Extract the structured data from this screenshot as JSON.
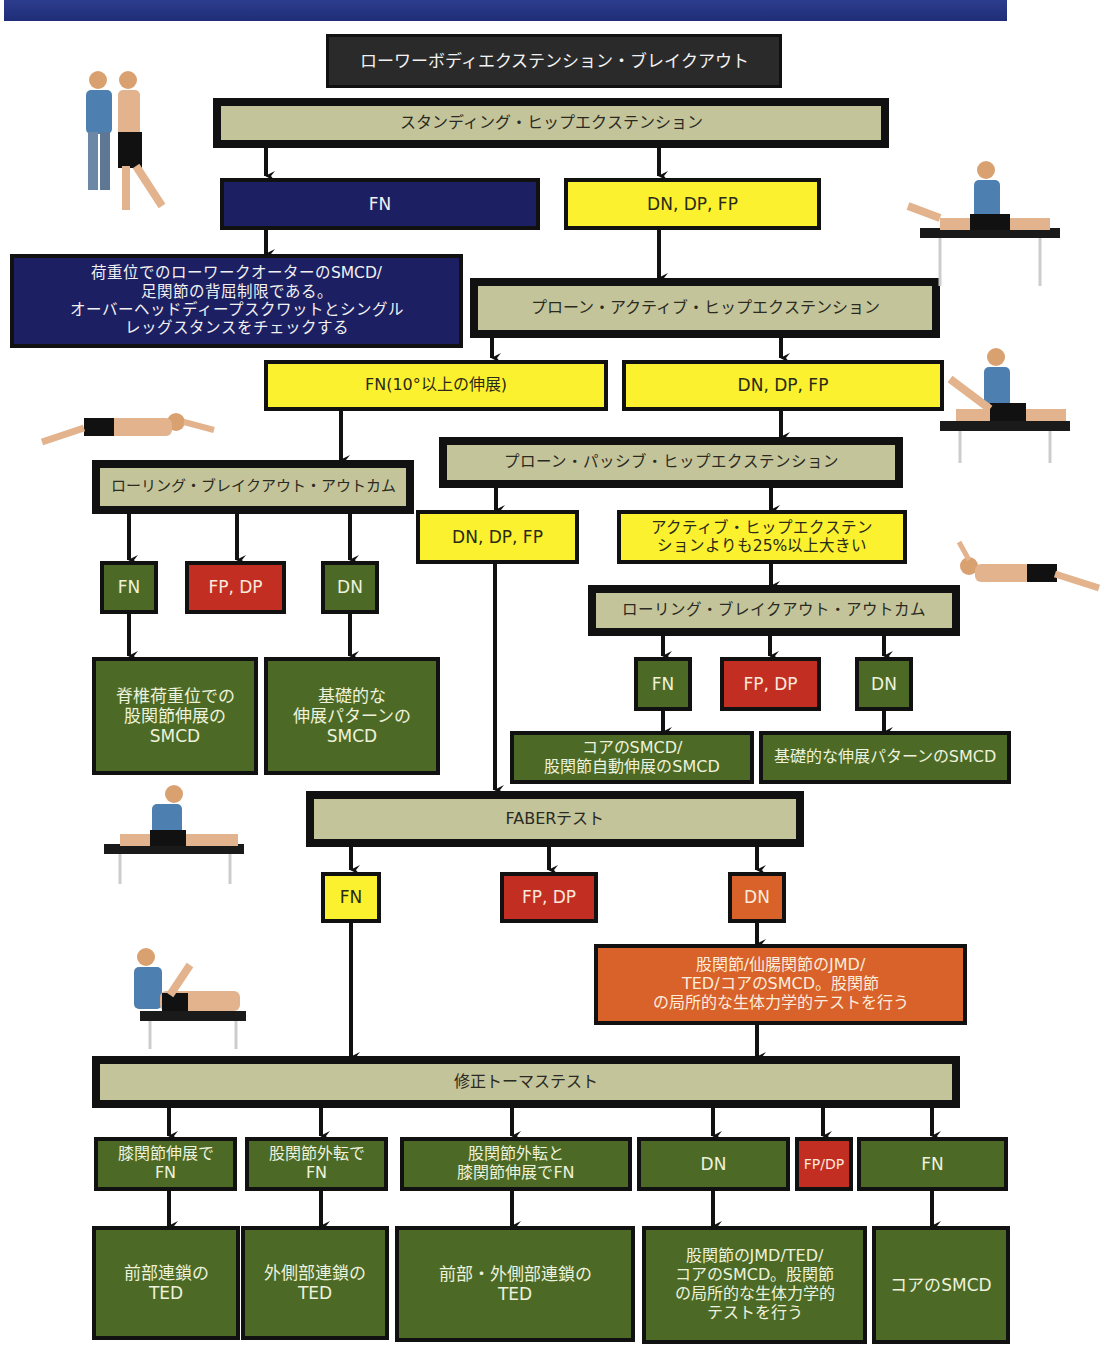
{
  "diagram": {
    "title": "ローワーボディエクステンション・ブレイクアウト",
    "standing": {
      "test": "スタンディング・ヒップエクステンション",
      "fn": "FN",
      "fn_result": "荷重位でのローワークオーターのSMCD/\n足関節の背屈制限である。\nオーバーヘッドディープスクワットとシングル\nレッグスタンスをチェックする",
      "dn": "DN, DP, FP"
    },
    "prone_active": {
      "test": "プローン・アクティブ・ヒップエクステンション",
      "fn": "FN(10°以上の伸展)",
      "dn": "DN, DP, FP"
    },
    "rolling_left": {
      "test": "ローリング・ブレイクアウト・アウトカム",
      "fn": "FN",
      "fp": "FP, DP",
      "dn": "DN",
      "fn_result": "脊椎荷重位での\n股関節伸展の\nSMCD",
      "dn_result": "基礎的な\n伸展パターンの\nSMCD"
    },
    "prone_passive": {
      "test": "プローン・パッシブ・ヒップエクステンション",
      "dn": "DN, DP, FP",
      "greater": "アクティブ・ヒップエクステン\nションよりも25%以上大きい"
    },
    "rolling_right": {
      "test": "ローリング・ブレイクアウト・アウトカム",
      "fn": "FN",
      "fp": "FP, DP",
      "dn": "DN",
      "fn_result": "コアのSMCD/\n股関節自動伸展のSMCD",
      "dn_result": "基礎的な伸展パターンのSMCD"
    },
    "faber": {
      "test": "FABERテスト",
      "fn": "FN",
      "fp": "FP, DP",
      "dn": "DN",
      "dn_result": "股関節/仙腸関節のJMD/\nTED/コアのSMCD。股関節\nの局所的な生体力学的テストを行う"
    },
    "thomas": {
      "test": "修正トーマステスト",
      "outcomes": [
        {
          "label": "膝関節伸展で\nFN",
          "result": "前部連鎖の\nTED"
        },
        {
          "label": "股関節外転で\nFN",
          "result": "外側部連鎖の\nTED"
        },
        {
          "label": "股関節外転と\n膝関節伸展でFN",
          "result": "前部・外側部連鎖の\nTED"
        },
        {
          "label": "DN",
          "result": "股関節のJMD/TED/\nコアのSMCD。股関節\nの局所的な生体力学的\nテストを行う"
        },
        {
          "label": "FP/DP"
        },
        {
          "label": "FN",
          "result": "コアのSMCD"
        }
      ]
    },
    "photos": [
      "standing-hip-extension-photo",
      "prone-active-hip-extension-photo",
      "prone-passive-hip-extension-photo",
      "rolling-photo-left",
      "rolling-photo-right",
      "faber-test-photo",
      "thomas-test-photo"
    ]
  },
  "colors": {
    "navy": "#1c2063",
    "yellow": "#fbf12e",
    "khaki": "#c4c49a",
    "green": "#4c6a26",
    "red": "#c22e22",
    "orange": "#d8622a",
    "black": "#2a2a2a"
  }
}
